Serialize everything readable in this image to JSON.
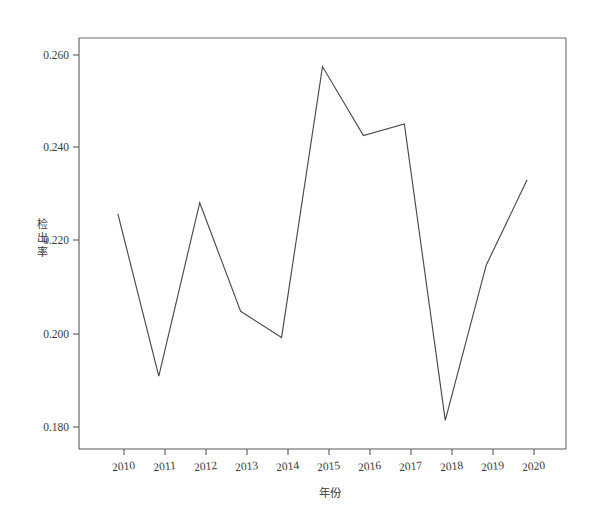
{
  "chart_data": {
    "type": "line",
    "title": "",
    "subtitle": "",
    "xlabel": "年份",
    "ylabel": "检出率",
    "ylabel_chars": [
      "检",
      "出",
      "率"
    ],
    "categories": [
      "2010",
      "2011",
      "2012",
      "2013",
      "2014",
      "2015",
      "2016",
      "2017",
      "2018",
      "2019",
      "2020"
    ],
    "x": [
      2010,
      2011,
      2012,
      2013,
      2014,
      2015,
      2016,
      2017,
      2018,
      2019,
      2020
    ],
    "values": [
      0.2256,
      0.1908,
      0.228,
      0.2047,
      0.1991,
      0.2572,
      0.2424,
      0.2449,
      0.1813,
      0.2146,
      0.2329
    ],
    "series": [
      {
        "name": "检出率",
        "values": [
          0.2256,
          0.1908,
          0.228,
          0.2047,
          0.1991,
          0.2572,
          0.2424,
          0.2449,
          0.1813,
          0.2146,
          0.2329
        ]
      }
    ],
    "ytick_labels": [
      "0.260",
      "0.240",
      "0.220",
      "0.200",
      "0.180"
    ],
    "ytick_values": [
      0.26,
      0.24,
      0.22,
      0.2,
      0.18
    ],
    "ylim": [
      0.1755,
      0.2632
    ],
    "xlim": [
      2009.05,
      2020.95
    ],
    "grid": false,
    "legend": false,
    "legend_position": "none",
    "line_color": "#4a4a4a",
    "axis_color": "#555a5f",
    "background_color": "#ffffff"
  },
  "axes": {
    "y_title": "检出率",
    "x_title": "年份"
  }
}
